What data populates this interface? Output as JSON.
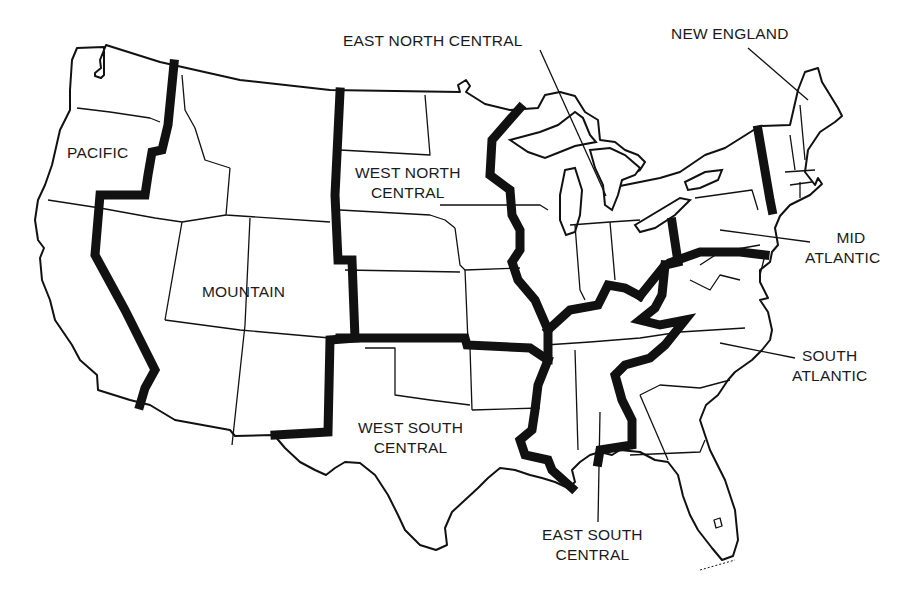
{
  "map": {
    "title": "United States Census Divisions",
    "style": {
      "outline_color": "#111111",
      "background": "#ffffff",
      "region_boundary_width": 9
    },
    "regions": [
      {
        "id": "pacific",
        "label_lines": [
          "PACIFIC"
        ]
      },
      {
        "id": "mountain",
        "label_lines": [
          "MOUNTAIN"
        ]
      },
      {
        "id": "west_north_central",
        "label_lines": [
          "WEST NORTH",
          "CENTRAL"
        ]
      },
      {
        "id": "east_north_central",
        "label_lines": [
          "EAST NORTH CENTRAL"
        ]
      },
      {
        "id": "new_england",
        "label_lines": [
          "NEW ENGLAND"
        ]
      },
      {
        "id": "mid_atlantic",
        "label_lines": [
          "MID",
          "ATLANTIC"
        ]
      },
      {
        "id": "south_atlantic",
        "label_lines": [
          "SOUTH",
          "ATLANTIC"
        ]
      },
      {
        "id": "east_south_central",
        "label_lines": [
          "EAST SOUTH",
          "CENTRAL"
        ]
      },
      {
        "id": "west_south_central",
        "label_lines": [
          "WEST SOUTH",
          "CENTRAL"
        ]
      }
    ]
  }
}
